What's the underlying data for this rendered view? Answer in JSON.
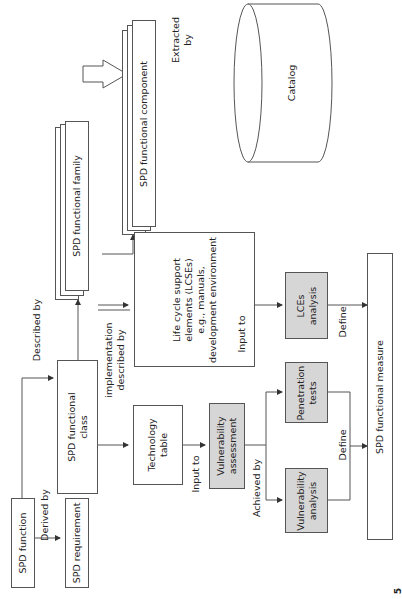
{
  "diagram": {
    "orientation": "rotated -90deg",
    "nodes": {
      "spd_function": "SPD function",
      "spd_requirement": "SPD requirement",
      "spd_functional_class": "SPD functional\nclass",
      "spd_functional_family": "SPD functional family",
      "spd_functional_component": "SPD functional component",
      "catalog": "Catalog",
      "technology_table": "Technology\ntable",
      "vulnerability_assessment": "Vulnerability\nassessment",
      "life_cycle_support": "Life cycle support\nelements (LCSEs)\ne.g., manuals,\ndevelopment environment",
      "vulnerability_analysis": "Vulnerability\nanalysis",
      "penetration_tests": "Penetration\ntests",
      "lces_analysis": "LCEs\nanalysis",
      "spd_functional_measure": "SPD functional measure"
    },
    "edges": {
      "derived_by": "Derived by",
      "described_by": "Described by",
      "implementation_described_by": "implementation\ndescribed by",
      "extracted_by": "Extracted\nby",
      "input_to_tech": "Input to",
      "input_to_lcse": "Input to",
      "achieved_by": "Achieved by",
      "define_left": "Define",
      "define_right": "Define"
    },
    "colors": {
      "line": "#555555",
      "gray_fill": "#d6d6d6",
      "white_fill": "#ffffff"
    },
    "corner_mark": "5"
  }
}
